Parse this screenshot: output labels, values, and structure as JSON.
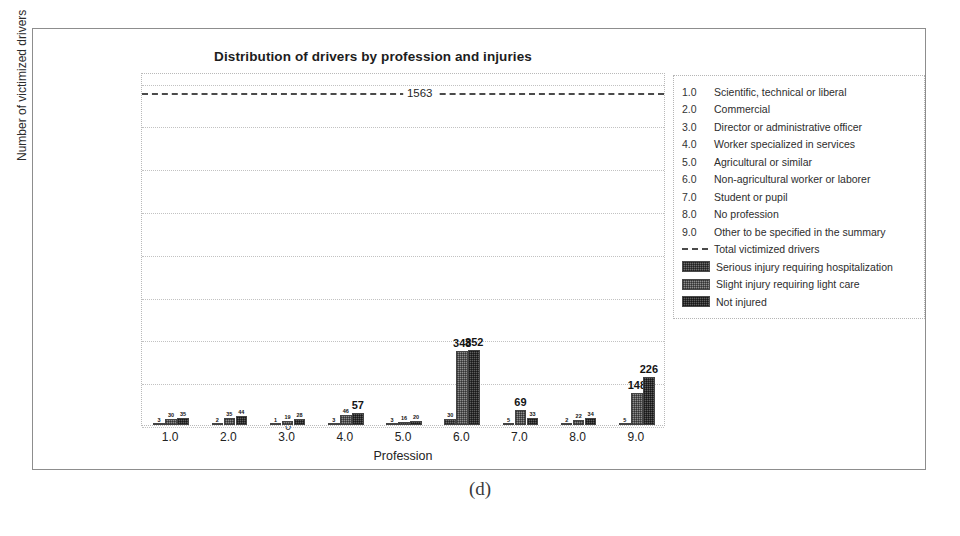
{
  "caption": "(d)",
  "chart_data": {
    "type": "bar",
    "title": "Distribution of drivers by profession and injuries",
    "xlabel": "Profession",
    "ylabel": "Number of victimized drivers",
    "ylim": [
      0,
      1650
    ],
    "yticks": [
      0,
      200,
      400,
      600,
      800,
      1000,
      1200,
      1400,
      1600
    ],
    "grid": true,
    "legend_position": "right-outside",
    "categories": [
      "1.0",
      "2.0",
      "3.0",
      "4.0",
      "5.0",
      "6.0",
      "7.0",
      "8.0",
      "9.0"
    ],
    "series": [
      {
        "name": "Serious injury requiring hospitalization",
        "values": [
          3,
          2,
          1,
          3,
          3,
          30,
          5,
          2,
          5
        ]
      },
      {
        "name": "Slight injury requiring light care",
        "values": [
          30,
          35,
          19,
          46,
          16,
          348,
          69,
          22,
          148
        ]
      },
      {
        "name": "Not injured",
        "values": [
          35,
          44,
          28,
          57,
          20,
          352,
          33,
          34,
          226
        ]
      }
    ],
    "annotations": {
      "total_line": {
        "label": "1563",
        "value": 1563,
        "style": "dashed",
        "series_name": "Total victimized drivers"
      }
    }
  },
  "legend": {
    "profession_codes": [
      {
        "key": "1.0",
        "label": "Scientific, technical or liberal"
      },
      {
        "key": "2.0",
        "label": "Commercial"
      },
      {
        "key": "3.0",
        "label": "Director or administrative officer"
      },
      {
        "key": "4.0",
        "label": "Worker specialized in services"
      },
      {
        "key": "5.0",
        "label": "Agricultural or similar"
      },
      {
        "key": "6.0",
        "label": "Non-agricultural worker or laborer"
      },
      {
        "key": "7.0",
        "label": "Student or pupil"
      },
      {
        "key": "8.0",
        "label": "No profession"
      },
      {
        "key": "9.0",
        "label": "Other to be specified in the summary"
      }
    ],
    "series_entries": [
      {
        "label": "Total victimized drivers",
        "marker": "dashed-line"
      },
      {
        "label": "Serious injury requiring hospitalization",
        "marker": "hatched-swatch-serious"
      },
      {
        "label": "Slight injury requiring light care",
        "marker": "hatched-swatch-slight"
      },
      {
        "label": "Not injured",
        "marker": "hatched-swatch-notinjured"
      }
    ]
  }
}
